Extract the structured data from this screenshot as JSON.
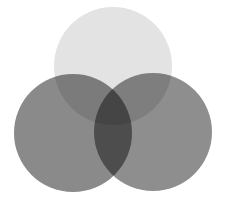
{
  "diagram": {
    "type": "venn",
    "sets": [
      {
        "name": "top",
        "cx": 113,
        "cy": 66,
        "r": 59,
        "color": "#e3e3e3"
      },
      {
        "name": "left",
        "cx": 73,
        "cy": 133,
        "r": 59,
        "color": "#8a8a8a"
      },
      {
        "name": "right",
        "cx": 153,
        "cy": 132,
        "r": 59,
        "color": "#8e8e8e"
      }
    ],
    "background": "#ffffff"
  }
}
